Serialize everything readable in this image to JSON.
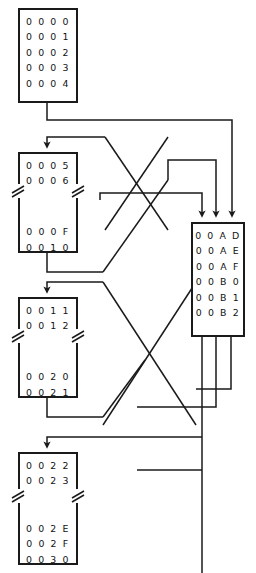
{
  "diagram": {
    "line_color": "#1a1a1a",
    "text_color": "#111111",
    "background": "#ffffff",
    "blocks": [
      {
        "id": "block-1",
        "name": "memory-block-0000",
        "x": 18,
        "y": 8,
        "w": 60,
        "h": 95,
        "has_break": false,
        "rows_top": [
          "0 0 0 0",
          "0 0 0 1",
          "0 0 0 2",
          "0 0 0 3",
          "0 0 0 4"
        ],
        "rows_bottom": []
      },
      {
        "id": "block-2",
        "name": "memory-block-0005",
        "x": 18,
        "y": 152,
        "w": 60,
        "h": 101,
        "has_break": true,
        "rows_top": [
          "0 0 0 5",
          "0 0 0 6"
        ],
        "rows_bottom": [
          "0 0 0 F",
          "0 0 1 0"
        ]
      },
      {
        "id": "block-3",
        "name": "memory-block-0011",
        "x": 18,
        "y": 297,
        "w": 60,
        "h": 101,
        "has_break": true,
        "rows_top": [
          "0 0 1 1",
          "0 0 1 2"
        ],
        "rows_bottom": [
          "0 0 2 0",
          "0 0 2 1"
        ]
      },
      {
        "id": "block-4",
        "name": "memory-block-0022",
        "x": 18,
        "y": 452,
        "w": 60,
        "h": 113,
        "has_break": true,
        "rows_top": [
          "0 0 2 2",
          "0 0 2 3"
        ],
        "rows_bottom": [
          "0 0 2 E",
          "0 0 2 F",
          "0 0 3 0"
        ]
      },
      {
        "id": "block-5",
        "name": "memory-block-00AD",
        "x": 191,
        "y": 222,
        "w": 54,
        "h": 115,
        "has_break": false,
        "rows_top": [
          "0 0 A D",
          "0 0 A E",
          "0 0 A F",
          "0 0 B 0",
          "0 0 B 1",
          "0 0 B 2"
        ],
        "rows_bottom": []
      }
    ],
    "connectors": [
      {
        "name": "link-block1-to-block5-in3",
        "path": "M47,103 L47,120 L232,120 L232,216",
        "arrow_at": {
          "x": 232,
          "y": 222
        }
      },
      {
        "name": "link-block2-in-from-diagonal",
        "path": "M47,146 L47,137 L105,137 L134,186",
        "arrow_at": {
          "x": 47,
          "y": 152
        }
      },
      {
        "name": "link-block2-out-to-block5-in2",
        "path": "M47,253 L47,272 L100,272 L134,224 L134,272 L216,272",
        "arrow_at": null
      },
      {
        "name": "link-block3-in-from-diagonal",
        "path": "M47,291 L47,282 L105,282 L134,331",
        "arrow_at": {
          "x": 47,
          "y": 297
        }
      },
      {
        "name": "link-block3-out-to-crossing",
        "path": "M47,398 L47,417 L100,417 L134,369",
        "arrow_at": null
      },
      {
        "name": "link-to-block4-in",
        "path": "M47,446 L47,437 L220,437",
        "arrow_at": {
          "x": 47,
          "y": 452
        }
      },
      {
        "name": "link-block5-out1",
        "path": "M202,337 L202,573",
        "arrow_at": null
      },
      {
        "name": "link-block5-out2",
        "path": "M216,337 L216,407 L137,407",
        "arrow_at": null
      },
      {
        "name": "link-block5-out3",
        "path": "M231,337 L231,437",
        "arrow_at": null
      },
      {
        "name": "link-diagonal-upper-left",
        "path": "M134,186 L196,262",
        "arrow_at": null
      },
      {
        "name": "link-diagonal-upper-right",
        "path": "M196,186 L134,262",
        "arrow_at": null
      },
      {
        "name": "link-block5-in1",
        "path": "M202,216",
        "arrow_at": {
          "x": 202,
          "y": 222
        }
      },
      {
        "name": "link-block5-in2",
        "path": "M216,216",
        "arrow_at": {
          "x": 216,
          "y": 222
        }
      }
    ]
  }
}
